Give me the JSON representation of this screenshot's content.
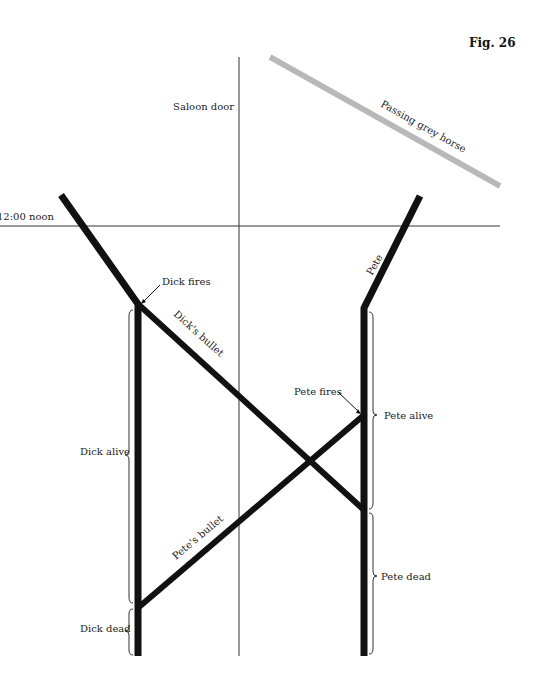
{
  "figure": {
    "title": "Fig. 26",
    "type": "spacetime-diagram"
  },
  "axes": {
    "time_reference_label": "12:00 noon",
    "space_reference_label": "Saloon door"
  },
  "worldlines": {
    "horse_label": "Passing grey horse",
    "pete_label": "Pete",
    "dick_bullet_label": "Dick's bullet",
    "pete_bullet_label": "Pete's bullet"
  },
  "events": {
    "dick_fires": "Dick fires",
    "pete_fires": "Pete fires"
  },
  "intervals": {
    "dick_alive": "Dick alive",
    "dick_dead": "Dick dead",
    "pete_alive": "Pete alive",
    "pete_dead": "Pete dead"
  },
  "colors": {
    "ink": "#111111",
    "horse": "#b8b8b8",
    "thin_line": "#333333"
  }
}
